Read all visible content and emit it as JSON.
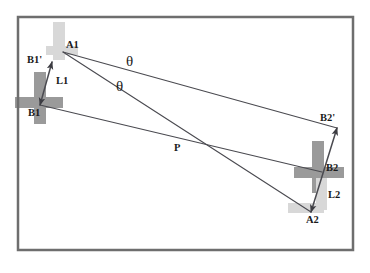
{
  "diagram": {
    "frame": {
      "x": 18,
      "y": 17,
      "width": 335,
      "height": 233,
      "border_color": "#6e6e6e",
      "border_width": 2.5,
      "fill": "#ffffff"
    },
    "colors": {
      "line": "#4a4a50",
      "label": "#1a1a1a",
      "marker_dark": "#9a9a9a",
      "marker_light": "#d8d8d8",
      "background": "#ffffff",
      "frame": "#6e6e6e"
    },
    "points": [
      {
        "id": "A1",
        "label": "A1",
        "x": 63,
        "y": 52,
        "label_x": 66,
        "label_y": 40
      },
      {
        "id": "B1p",
        "label": "B1'",
        "x": 52,
        "y": 62,
        "label_x": 27,
        "label_y": 55
      },
      {
        "id": "B1",
        "label": "B1",
        "x": 40,
        "y": 105,
        "label_x": 28,
        "label_y": 108
      },
      {
        "id": "P",
        "label": "P",
        "x": 180,
        "y": 152,
        "label_x": 174,
        "label_y": 143
      },
      {
        "id": "B2p",
        "label": "B2'",
        "x": 337,
        "y": 128,
        "label_x": 320,
        "label_y": 113
      },
      {
        "id": "B2",
        "label": "B2",
        "x": 322,
        "y": 172,
        "label_x": 326,
        "label_y": 163
      },
      {
        "id": "A2",
        "label": "A2",
        "x": 311,
        "y": 212,
        "label_x": 306,
        "label_y": 215
      }
    ],
    "segments": [
      {
        "id": "A1-B2p",
        "label": "",
        "from": "A1",
        "to": "B2p",
        "arrow": "none"
      },
      {
        "id": "A1-A2",
        "label": "",
        "from": "A1",
        "to": "A2",
        "arrow": "none"
      },
      {
        "id": "B1-B2",
        "label": "",
        "from": "B1",
        "to": "B2",
        "arrow": "none"
      },
      {
        "id": "B1-B1p",
        "label": "L1",
        "from": "B1",
        "to": "B1p",
        "arrow": "both",
        "label_x": 56,
        "label_y": 76
      },
      {
        "id": "A2-B2p",
        "label": "L2",
        "from": "A2",
        "to": "B2p",
        "arrow": "both",
        "label_x": 328,
        "label_y": 190
      }
    ],
    "angles": [
      {
        "id": "theta-upper",
        "label": "θ",
        "x": 126,
        "y": 54,
        "vertex": "A1",
        "between": [
          "A1-B2p",
          "A1-A2"
        ]
      },
      {
        "id": "theta-lower",
        "label": "θ",
        "x": 116,
        "y": 79,
        "vertex": "A1",
        "between": [
          "A1-A2",
          "B1-B2"
        ]
      }
    ],
    "markers": [
      {
        "id": "marker-a1-light",
        "kind": "vertical-band",
        "shade": "light",
        "x": 53,
        "y": 22,
        "width": 12,
        "height": 38
      },
      {
        "id": "marker-a1-light-h",
        "kind": "horizontal-band",
        "shade": "light",
        "x": 46,
        "y": 46,
        "width": 32,
        "height": 9
      },
      {
        "id": "marker-b1-cross-v",
        "kind": "vertical-band",
        "shade": "dark",
        "x": 34,
        "y": 72,
        "width": 12,
        "height": 52
      },
      {
        "id": "marker-b1-cross-h",
        "kind": "horizontal-band",
        "shade": "dark",
        "x": 15,
        "y": 97,
        "width": 48,
        "height": 11
      },
      {
        "id": "marker-b2-cross-v",
        "kind": "vertical-band",
        "shade": "dark",
        "x": 312,
        "y": 141,
        "width": 12,
        "height": 52
      },
      {
        "id": "marker-b2-cross-h",
        "kind": "horizontal-band",
        "shade": "dark",
        "x": 294,
        "y": 167,
        "width": 50,
        "height": 11
      },
      {
        "id": "marker-a2-light-v",
        "kind": "vertical-band",
        "shade": "light",
        "x": 316,
        "y": 178,
        "width": 11,
        "height": 32
      },
      {
        "id": "marker-a2-light-h",
        "kind": "horizontal-band",
        "shade": "light",
        "x": 288,
        "y": 203,
        "width": 36,
        "height": 10
      }
    ]
  }
}
